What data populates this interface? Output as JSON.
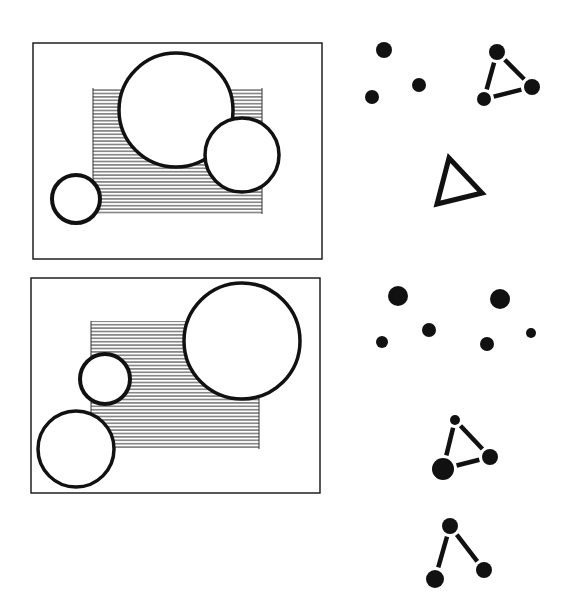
{
  "figure": {
    "width": 569,
    "height": 614,
    "background": "#ffffff",
    "ink": "#111111",
    "hatch_color": "#333333",
    "hatch_spacing": 3.4
  },
  "panels": [
    {
      "id": "panel-top",
      "frame": {
        "x": 33,
        "y": 43,
        "w": 289,
        "h": 216
      },
      "hatched_rect": {
        "x": 93,
        "y": 88,
        "w": 169,
        "h": 126
      },
      "circles": [
        {
          "id": "large-circle",
          "cx": 176,
          "cy": 110,
          "r": 57,
          "stroke": 3.5
        },
        {
          "id": "right-circle",
          "cx": 242,
          "cy": 155,
          "r": 37,
          "stroke": 3.5
        },
        {
          "id": "small-left-circle",
          "cx": 76,
          "cy": 199,
          "r": 24,
          "stroke": 4
        }
      ]
    },
    {
      "id": "panel-bottom",
      "frame": {
        "x": 31,
        "y": 278,
        "w": 289,
        "h": 215
      },
      "hatched_rect": {
        "x": 91,
        "y": 321,
        "w": 168,
        "h": 128
      },
      "circles": [
        {
          "id": "large-circle",
          "cx": 242,
          "cy": 341,
          "r": 58,
          "stroke": 3.5
        },
        {
          "id": "small-middle-circle",
          "cx": 105,
          "cy": 379,
          "r": 25,
          "stroke": 4
        },
        {
          "id": "lower-left-circle",
          "cx": 76,
          "cy": 449,
          "r": 38,
          "stroke": 3.5
        }
      ]
    }
  ],
  "dot_groups": [
    {
      "id": "top-scattered-dots",
      "dots": [
        {
          "cx": 384,
          "cy": 50,
          "r": 8
        },
        {
          "cx": 372,
          "cy": 97,
          "r": 7
        },
        {
          "cx": 419,
          "cy": 85,
          "r": 7
        }
      ],
      "edges": []
    },
    {
      "id": "top-connected-triangle",
      "dots": [
        {
          "cx": 497,
          "cy": 52,
          "r": 8
        },
        {
          "cx": 532,
          "cy": 87,
          "r": 8
        },
        {
          "cx": 484,
          "cy": 99,
          "r": 7
        }
      ],
      "edges": [
        [
          0,
          1
        ],
        [
          1,
          2
        ],
        [
          2,
          0
        ]
      ]
    },
    {
      "id": "bottom-scattered-dots-left",
      "dots": [
        {
          "cx": 398,
          "cy": 296,
          "r": 10
        },
        {
          "cx": 382,
          "cy": 342,
          "r": 6
        },
        {
          "cx": 429,
          "cy": 330,
          "r": 7
        }
      ],
      "edges": []
    },
    {
      "id": "bottom-scattered-dots-right",
      "dots": [
        {
          "cx": 500,
          "cy": 299,
          "r": 10
        },
        {
          "cx": 487,
          "cy": 344,
          "r": 7
        },
        {
          "cx": 531,
          "cy": 333,
          "r": 5
        }
      ],
      "edges": []
    },
    {
      "id": "bottom-connected-triangle",
      "dots": [
        {
          "cx": 455,
          "cy": 420,
          "r": 5
        },
        {
          "cx": 490,
          "cy": 457,
          "r": 8
        },
        {
          "cx": 443,
          "cy": 469,
          "r": 11
        }
      ],
      "edges": [
        [
          0,
          1
        ],
        [
          1,
          2
        ],
        [
          2,
          0
        ]
      ]
    },
    {
      "id": "bottom-open-graph",
      "dots": [
        {
          "cx": 450,
          "cy": 526,
          "r": 8
        },
        {
          "cx": 435,
          "cy": 579,
          "r": 9
        },
        {
          "cx": 484,
          "cy": 570,
          "r": 8
        }
      ],
      "edges": [
        [
          0,
          1
        ],
        [
          0,
          2
        ]
      ]
    }
  ],
  "outline_triangles": [
    {
      "id": "outline-triangle",
      "points": [
        [
          449,
          158
        ],
        [
          482,
          193
        ],
        [
          437,
          204
        ]
      ],
      "stroke": 5
    }
  ]
}
